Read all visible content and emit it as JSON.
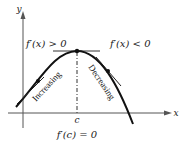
{
  "diagram": {
    "axes": {
      "x_label": "x",
      "y_label": "y"
    },
    "critical_point_label": "c",
    "left_condition": "f′(x) > 0",
    "right_condition": "f′(x) < 0",
    "critical_condition": "f′(c) = 0",
    "left_region_label": "Increasing",
    "right_region_label": "Decreasing",
    "colors": {
      "ink": "#222222",
      "axis": "#555555",
      "background": "#ffffff"
    }
  }
}
